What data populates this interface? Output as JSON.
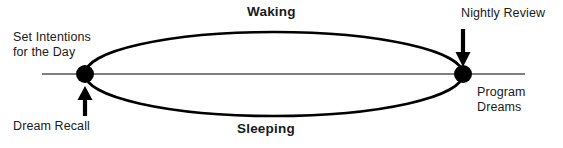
{
  "diagram": {
    "type": "cycle-loop",
    "colors": {
      "background": "#ffffff",
      "stroke": "#000000",
      "axis": "#555555",
      "text": "#1a1a1a"
    },
    "phases": {
      "upper_label": "Waking",
      "lower_label": "Sleeping"
    },
    "nodes": [
      {
        "id": "morning",
        "label": "Set Intentions\nfor the Day",
        "label_line_1": "Set Intentions",
        "label_line_2": "for the Day",
        "secondary_label": "Dream Recall",
        "x": 85,
        "y": 74,
        "arrow": "up"
      },
      {
        "id": "evening",
        "label": "Nightly Review",
        "secondary_label": "Program\nDreams",
        "secondary_line_1": "Program",
        "secondary_line_2": "Dreams",
        "x": 463,
        "y": 74,
        "arrow": "down"
      }
    ],
    "labels": {
      "set_intentions_line1": "Set Intentions",
      "set_intentions_line2": "for the Day",
      "dream_recall": "Dream Recall",
      "nightly_review": "Nightly Review",
      "program_dreams_line1": "Program",
      "program_dreams_line2": "Dreams",
      "waking": "Waking",
      "sleeping": "Sleeping"
    },
    "geometry": {
      "axis_line": {
        "x1": 42,
        "y1": 74,
        "x2": 525,
        "y2": 74
      },
      "ellipse": {
        "cx": 274,
        "cy": 74,
        "rx": 189,
        "ry": 42
      },
      "node_radius": 9,
      "arrow_up": {
        "x": 85,
        "y_tip": 87,
        "y_tail": 116
      },
      "arrow_down": {
        "x": 463,
        "y_tip": 66,
        "y_tail": 29
      }
    }
  }
}
